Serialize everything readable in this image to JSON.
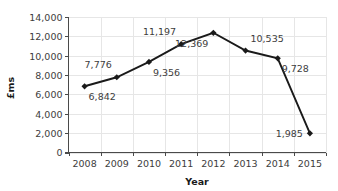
{
  "chart_data": {
    "type": "line",
    "title": "",
    "xlabel": "Year",
    "ylabel": "£ms",
    "categories": [
      "2008",
      "2009",
      "2010",
      "2011",
      "2012",
      "2013",
      "2014",
      "2015"
    ],
    "values": [
      6842,
      7776,
      9356,
      11197,
      12369,
      10535,
      9728,
      1985
    ],
    "point_labels": [
      "6,842",
      "7,776",
      "9,356",
      "11,197",
      "12,369",
      "10,535",
      "9,728",
      "1,985"
    ],
    "label_positions": [
      "below-right",
      "above-left",
      "below-right",
      "above-left",
      "below-left",
      "above-right",
      "below-right",
      "left"
    ],
    "ylim": [
      0,
      14000
    ],
    "ytick_step": 2000,
    "ytick_labels": [
      "0",
      "2,000",
      "4,000",
      "6,000",
      "8,000",
      "10,000",
      "12,000",
      "14,000"
    ],
    "ytick_values": [
      0,
      2000,
      4000,
      6000,
      8000,
      10000,
      12000,
      14000
    ],
    "grid": true,
    "grid_axis": "both",
    "legend": false,
    "legend_position": "none",
    "marker": "diamond",
    "line_color": "#1a1a1a",
    "grid_color": "#e6e6e6",
    "axis_color": "#4a4a4a",
    "label_color": "#3d3d3d",
    "background_color": "#ffffff"
  },
  "axes": {
    "x_title": "Year",
    "y_title": "£ms"
  }
}
